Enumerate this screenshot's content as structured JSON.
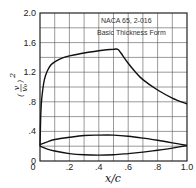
{
  "chart_data": {
    "type": "line",
    "title": "",
    "legend": [
      "NACA 65, 2-016",
      "Basic Thickness Form"
    ],
    "legend_position": "top-right",
    "xlabel": "x/c",
    "ylabel": "(v/v0)^2",
    "xlim": [
      0,
      1.0
    ],
    "ylim": [
      0,
      2.0
    ],
    "grid": true,
    "x_ticks": [
      "0",
      ".2",
      ".4",
      ".6",
      ".8",
      "1.0"
    ],
    "y_ticks": [
      "0",
      ".4",
      ".8",
      "1.2",
      "1.6",
      "2.0"
    ],
    "series": [
      {
        "name": "velocity distribution (v/v0)^2",
        "x": [
          0,
          0.005,
          0.01,
          0.02,
          0.03,
          0.05,
          0.075,
          0.1,
          0.15,
          0.2,
          0.3,
          0.4,
          0.5,
          0.53,
          0.55,
          0.6,
          0.65,
          0.7,
          0.8,
          0.9,
          1.0
        ],
        "y": [
          0.2,
          0.6,
          0.8,
          0.98,
          1.1,
          1.22,
          1.3,
          1.34,
          1.39,
          1.42,
          1.46,
          1.49,
          1.51,
          1.51,
          1.46,
          1.32,
          1.2,
          1.1,
          0.96,
          0.85,
          0.77
        ]
      },
      {
        "name": "airfoil upper surface",
        "x": [
          0,
          0.05,
          0.1,
          0.2,
          0.3,
          0.4,
          0.5,
          0.6,
          0.7,
          0.8,
          0.9,
          1.0
        ],
        "y": [
          0.22,
          0.26,
          0.29,
          0.32,
          0.345,
          0.35,
          0.35,
          0.335,
          0.31,
          0.28,
          0.245,
          0.21
        ]
      },
      {
        "name": "airfoil lower surface",
        "x": [
          0,
          0.05,
          0.1,
          0.2,
          0.3,
          0.4,
          0.5,
          0.6,
          0.7,
          0.8,
          0.9,
          1.0
        ],
        "y": [
          0.2,
          0.16,
          0.135,
          0.1,
          0.085,
          0.08,
          0.085,
          0.1,
          0.12,
          0.145,
          0.175,
          0.21
        ]
      }
    ]
  },
  "labels": {
    "legend_line1": "NACA 65, 2-016",
    "legend_line2": "Basic Thickness Form",
    "xlabel": "x/c",
    "ylabel_v": "v",
    "ylabel_v0": "v₀",
    "ylabel_exp": "2"
  }
}
